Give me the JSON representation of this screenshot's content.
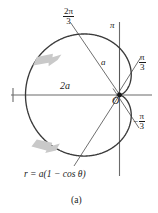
{
  "figure": {
    "caption": "(a)",
    "equation": "r = a(1 − cos θ)",
    "equation_parts": {
      "lhs": "r",
      "eq": "=",
      "rhs": "a(1 − cos θ)"
    },
    "curve_name": "cardioid",
    "colors": {
      "curve": "#3a3a3a",
      "axis": "#6b6b6b",
      "radial_line": "#555555",
      "arrow": "#c9c9c9",
      "text": "#1a1a1a",
      "background": "#ffffff"
    }
  },
  "labels": {
    "angle_2pi_over_3": {
      "numerator": "2π",
      "denominator": "3"
    },
    "angle_pi": "π",
    "angle_pi_over_3": {
      "numerator": "π",
      "denominator": "3"
    },
    "angle_neg_pi_over_3": {
      "sign": "−",
      "numerator": "π",
      "denominator": "3"
    },
    "radius_a": "a",
    "diameter_2a": "2a",
    "origin": "O"
  },
  "chart_data": {
    "type": "line",
    "title": "",
    "subtitle": "(a)",
    "xlabel": "",
    "ylabel": "",
    "annotations": [
      {
        "text": "2π/3",
        "kind": "angle-ray-label",
        "theta_deg": 120
      },
      {
        "text": "π",
        "kind": "axis-label",
        "theta_deg": 180
      },
      {
        "text": "π/3",
        "kind": "angle-ray-label",
        "theta_deg": 60
      },
      {
        "text": "−π/3",
        "kind": "angle-ray-label",
        "theta_deg": -60
      },
      {
        "text": "a",
        "kind": "segment-label"
      },
      {
        "text": "2a",
        "kind": "segment-label"
      },
      {
        "text": "O",
        "kind": "origin-label"
      },
      {
        "text": "r = a(1 − cos θ)",
        "kind": "equation-label"
      }
    ],
    "series": [
      {
        "name": "r = a(1 - cos theta)",
        "polar": true,
        "equation": "r = a(1 - cos(theta))",
        "a": 1,
        "theta_range_deg": [
          0,
          360
        ],
        "r_of_theta_deg": {
          "0": 0.0,
          "15": 0.034,
          "30": 0.134,
          "45": 0.293,
          "60": 0.5,
          "75": 0.741,
          "90": 1.0,
          "105": 1.259,
          "120": 1.5,
          "135": 1.707,
          "150": 1.866,
          "165": 1.966,
          "180": 2.0,
          "195": 1.966,
          "210": 1.866,
          "225": 1.707,
          "240": 1.5,
          "255": 1.259,
          "270": 1.0,
          "285": 0.741,
          "300": 0.5,
          "315": 0.293,
          "330": 0.134,
          "345": 0.034,
          "360": 0.0
        }
      }
    ],
    "rays_deg": [
      120,
      60,
      -60
    ],
    "grid": false,
    "legend": false,
    "axes": {
      "horizontal": true,
      "vertical": true
    },
    "direction_arrows": [
      {
        "position": "upper-left",
        "points": "down-left"
      },
      {
        "position": "lower-left",
        "points": "up-left"
      }
    ]
  }
}
